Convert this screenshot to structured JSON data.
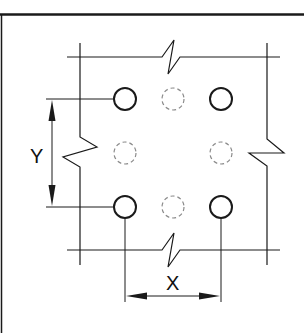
{
  "diagram": {
    "type": "bolt-pattern-spacing",
    "labels": {
      "x_dimension": "X",
      "y_dimension": "Y"
    },
    "colors": {
      "line": "#1a1a1a",
      "dashed": "#8a8a8a",
      "background": "#ffffff"
    },
    "holes": {
      "solid": [
        {
          "cx": 125,
          "cy": 99
        },
        {
          "cx": 221,
          "cy": 99
        },
        {
          "cx": 125,
          "cy": 207
        },
        {
          "cx": 221,
          "cy": 207
        }
      ],
      "dashed": [
        {
          "cx": 173,
          "cy": 99
        },
        {
          "cx": 125,
          "cy": 153
        },
        {
          "cx": 221,
          "cy": 153
        },
        {
          "cx": 173,
          "cy": 207
        }
      ],
      "radius": 11
    }
  }
}
